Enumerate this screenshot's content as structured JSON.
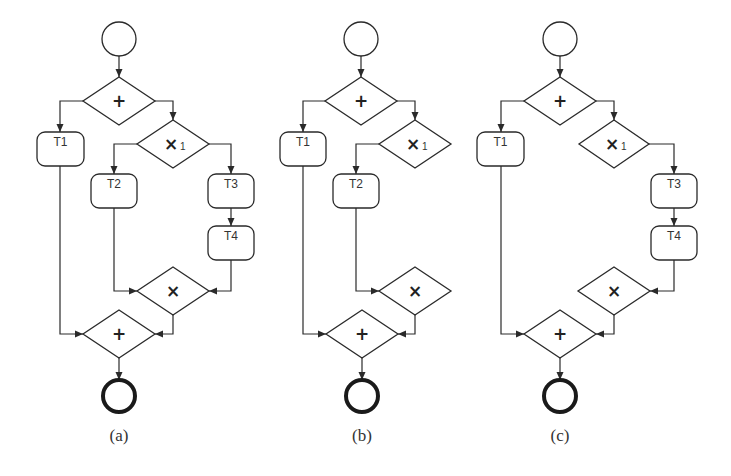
{
  "figure": {
    "panels": [
      {
        "id": "a",
        "caption": "(a)",
        "caption_pos": [
          119,
          441
        ],
        "nodes": [
          {
            "id": "start",
            "type": "start",
            "cx": 119,
            "cy": 39,
            "r": 17
          },
          {
            "id": "and-split",
            "type": "gateway",
            "symbol": "+",
            "cx": 119,
            "cy": 101,
            "hw": 36,
            "hh": 24
          },
          {
            "id": "T1",
            "type": "task",
            "label": "T1",
            "x": 37,
            "y": 132,
            "w": 47,
            "h": 34
          },
          {
            "id": "xor-split",
            "type": "gateway",
            "symbol": "×",
            "sub": "1",
            "cx": 173,
            "cy": 144,
            "hw": 36,
            "hh": 24
          },
          {
            "id": "T2",
            "type": "task",
            "label": "T2",
            "x": 91,
            "y": 174,
            "w": 46,
            "h": 34
          },
          {
            "id": "T3",
            "type": "task",
            "label": "T3",
            "x": 208,
            "y": 174,
            "w": 46,
            "h": 34
          },
          {
            "id": "T4",
            "type": "task",
            "label": "T4",
            "x": 208,
            "y": 226,
            "w": 46,
            "h": 34
          },
          {
            "id": "xor-join",
            "type": "gateway",
            "symbol": "×",
            "cx": 173,
            "cy": 291,
            "hw": 36,
            "hh": 24
          },
          {
            "id": "and-join",
            "type": "gateway",
            "symbol": "+",
            "cx": 119,
            "cy": 334,
            "hw": 36,
            "hh": 24
          },
          {
            "id": "end",
            "type": "end",
            "cx": 119,
            "cy": 396,
            "r": 16
          }
        ],
        "edges": [
          {
            "from": "start",
            "to": "and-split",
            "points": [
              [
                119,
                56
              ],
              [
                119,
                77
              ]
            ]
          },
          {
            "from": "and-split",
            "to": "T1",
            "points": [
              [
                83,
                101
              ],
              [
                60,
                101
              ],
              [
                60,
                132
              ]
            ]
          },
          {
            "from": "and-split",
            "to": "xor-split",
            "points": [
              [
                155,
                101
              ],
              [
                173,
                101
              ],
              [
                173,
                120
              ]
            ]
          },
          {
            "from": "xor-split",
            "to": "T2",
            "points": [
              [
                137,
                144
              ],
              [
                114,
                144
              ],
              [
                114,
                174
              ]
            ]
          },
          {
            "from": "xor-split",
            "to": "T3",
            "points": [
              [
                209,
                144
              ],
              [
                231,
                144
              ],
              [
                231,
                174
              ]
            ]
          },
          {
            "from": "T3",
            "to": "T4",
            "points": [
              [
                231,
                208
              ],
              [
                231,
                226
              ]
            ]
          },
          {
            "from": "T2",
            "to": "xor-join",
            "points": [
              [
                114,
                208
              ],
              [
                114,
                291
              ],
              [
                137,
                291
              ]
            ]
          },
          {
            "from": "T4",
            "to": "xor-join",
            "points": [
              [
                231,
                260
              ],
              [
                231,
                291
              ],
              [
                209,
                291
              ]
            ]
          },
          {
            "from": "T1",
            "to": "and-join",
            "points": [
              [
                60,
                166
              ],
              [
                60,
                334
              ],
              [
                83,
                334
              ]
            ]
          },
          {
            "from": "xor-join",
            "to": "and-join",
            "points": [
              [
                173,
                315
              ],
              [
                173,
                334
              ],
              [
                155,
                334
              ]
            ]
          },
          {
            "from": "and-join",
            "to": "end",
            "points": [
              [
                119,
                358
              ],
              [
                119,
                380
              ]
            ]
          }
        ]
      },
      {
        "id": "b",
        "caption": "(b)",
        "caption_pos": [
          362,
          441
        ],
        "nodes": [
          {
            "id": "start",
            "type": "start",
            "cx": 361,
            "cy": 39,
            "r": 17
          },
          {
            "id": "and-split",
            "type": "gateway",
            "symbol": "+",
            "cx": 361,
            "cy": 101,
            "hw": 36,
            "hh": 24
          },
          {
            "id": "T1",
            "type": "task",
            "label": "T1",
            "x": 280,
            "y": 132,
            "w": 46,
            "h": 34
          },
          {
            "id": "xor-split",
            "type": "gateway",
            "symbol": "×",
            "sub": "1",
            "cx": 415,
            "cy": 144,
            "hw": 36,
            "hh": 24
          },
          {
            "id": "T2",
            "type": "task",
            "label": "T2",
            "x": 333,
            "y": 174,
            "w": 46,
            "h": 34
          },
          {
            "id": "xor-join",
            "type": "gateway",
            "symbol": "×",
            "cx": 415,
            "cy": 291,
            "hw": 36,
            "hh": 24
          },
          {
            "id": "and-join",
            "type": "gateway",
            "symbol": "+",
            "cx": 362,
            "cy": 334,
            "hw": 36,
            "hh": 24
          },
          {
            "id": "end",
            "type": "end",
            "cx": 362,
            "cy": 396,
            "r": 16
          }
        ],
        "edges": [
          {
            "from": "start",
            "to": "and-split",
            "points": [
              [
                361,
                56
              ],
              [
                361,
                77
              ]
            ]
          },
          {
            "from": "and-split",
            "to": "T1",
            "points": [
              [
                325,
                101
              ],
              [
                303,
                101
              ],
              [
                303,
                132
              ]
            ]
          },
          {
            "from": "and-split",
            "to": "xor-split",
            "points": [
              [
                397,
                101
              ],
              [
                415,
                101
              ],
              [
                415,
                120
              ]
            ]
          },
          {
            "from": "xor-split",
            "to": "T2",
            "points": [
              [
                379,
                144
              ],
              [
                356,
                144
              ],
              [
                356,
                174
              ]
            ]
          },
          {
            "from": "T2",
            "to": "xor-join",
            "points": [
              [
                356,
                208
              ],
              [
                356,
                291
              ],
              [
                379,
                291
              ]
            ]
          },
          {
            "from": "T1",
            "to": "and-join",
            "points": [
              [
                303,
                166
              ],
              [
                303,
                334
              ],
              [
                326,
                334
              ]
            ]
          },
          {
            "from": "xor-join",
            "to": "and-join",
            "points": [
              [
                415,
                315
              ],
              [
                415,
                334
              ],
              [
                398,
                334
              ]
            ]
          },
          {
            "from": "and-join",
            "to": "end",
            "points": [
              [
                362,
                358
              ],
              [
                362,
                380
              ]
            ]
          }
        ]
      },
      {
        "id": "c",
        "caption": "(c)",
        "caption_pos": [
          560,
          441
        ],
        "nodes": [
          {
            "id": "start",
            "type": "start",
            "cx": 560,
            "cy": 39,
            "r": 17
          },
          {
            "id": "and-split",
            "type": "gateway",
            "symbol": "+",
            "cx": 560,
            "cy": 101,
            "hw": 36,
            "hh": 24
          },
          {
            "id": "T1",
            "type": "task",
            "label": "T1",
            "x": 477,
            "y": 132,
            "w": 47,
            "h": 34
          },
          {
            "id": "xor-split",
            "type": "gateway",
            "symbol": "×",
            "sub": "1",
            "cx": 614,
            "cy": 144,
            "hw": 35,
            "hh": 24
          },
          {
            "id": "T3",
            "type": "task",
            "label": "T3",
            "x": 651,
            "y": 174,
            "w": 46,
            "h": 34
          },
          {
            "id": "T4",
            "type": "task",
            "label": "T4",
            "x": 651,
            "y": 226,
            "w": 46,
            "h": 34
          },
          {
            "id": "xor-join",
            "type": "gateway",
            "symbol": "×",
            "cx": 614,
            "cy": 291,
            "hw": 36,
            "hh": 24
          },
          {
            "id": "and-join",
            "type": "gateway",
            "symbol": "+",
            "cx": 560,
            "cy": 334,
            "hw": 36,
            "hh": 24
          },
          {
            "id": "end",
            "type": "end",
            "cx": 560,
            "cy": 396,
            "r": 16
          }
        ],
        "edges": [
          {
            "from": "start",
            "to": "and-split",
            "points": [
              [
                560,
                56
              ],
              [
                560,
                77
              ]
            ]
          },
          {
            "from": "and-split",
            "to": "T1",
            "points": [
              [
                524,
                101
              ],
              [
                501,
                101
              ],
              [
                501,
                132
              ]
            ]
          },
          {
            "from": "and-split",
            "to": "xor-split",
            "points": [
              [
                596,
                101
              ],
              [
                614,
                101
              ],
              [
                614,
                120
              ]
            ]
          },
          {
            "from": "xor-split",
            "to": "T3",
            "points": [
              [
                649,
                144
              ],
              [
                674,
                144
              ],
              [
                674,
                174
              ]
            ]
          },
          {
            "from": "T3",
            "to": "T4",
            "points": [
              [
                674,
                208
              ],
              [
                674,
                226
              ]
            ]
          },
          {
            "from": "T4",
            "to": "xor-join",
            "points": [
              [
                674,
                260
              ],
              [
                674,
                291
              ],
              [
                650,
                291
              ]
            ]
          },
          {
            "from": "T1",
            "to": "and-join",
            "points": [
              [
                501,
                166
              ],
              [
                501,
                334
              ],
              [
                524,
                334
              ]
            ]
          },
          {
            "from": "xor-join",
            "to": "and-join",
            "points": [
              [
                614,
                315
              ],
              [
                614,
                334
              ],
              [
                596,
                334
              ]
            ]
          },
          {
            "from": "and-join",
            "to": "end",
            "points": [
              [
                560,
                358
              ],
              [
                560,
                380
              ]
            ]
          }
        ]
      }
    ]
  }
}
